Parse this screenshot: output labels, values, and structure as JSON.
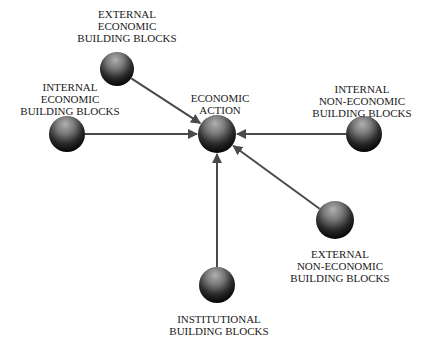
{
  "diagram": {
    "type": "hub-and-spoke",
    "background": "#ffffff",
    "colors": {
      "edge": "#4a4a4a",
      "text": "#1a1a1a",
      "sphere_light": "#9a9a9a",
      "sphere_dark": "#0a0a0a"
    },
    "center": {
      "id": "economic-action",
      "label_lines": [
        "ECONOMIC",
        "ACTION"
      ],
      "x": 217,
      "y": 134,
      "r": 19
    },
    "nodes": [
      {
        "id": "external-economic",
        "label_lines": [
          "EXTERNAL",
          "ECONOMIC",
          "BUILDING BLOCKS"
        ],
        "x": 117,
        "y": 69,
        "r": 17,
        "label_x": 127,
        "label_y": [
          18,
          30,
          42
        ]
      },
      {
        "id": "internal-economic",
        "label_lines": [
          "INTERNAL",
          "ECONOMIC",
          "BUILDING BLOCKS"
        ],
        "x": 67,
        "y": 134,
        "r": 18,
        "label_x": 70,
        "label_y": [
          91,
          103,
          115
        ]
      },
      {
        "id": "internal-non-economic",
        "label_lines": [
          "INTERNAL",
          "NON-ECONOMIC",
          "BUILDING BLOCKS"
        ],
        "x": 364,
        "y": 134,
        "r": 18,
        "label_x": 362,
        "label_y": [
          93,
          105,
          117
        ]
      },
      {
        "id": "external-non-economic",
        "label_lines": [
          "EXTERNAL",
          "NON-ECONOMIC",
          "BUILDING BLOCKS"
        ],
        "x": 335,
        "y": 220,
        "r": 19,
        "label_x": 340,
        "label_y": [
          258,
          270,
          282
        ]
      },
      {
        "id": "institutional",
        "label_lines": [
          "INSTITUTIONAL",
          "BUILDING BLOCKS"
        ],
        "x": 217,
        "y": 285,
        "r": 18,
        "label_x": 219,
        "label_y": [
          323,
          335
        ]
      }
    ],
    "edges": [
      {
        "from": "external-economic",
        "to": "economic-action"
      },
      {
        "from": "internal-economic",
        "to": "economic-action"
      },
      {
        "from": "internal-non-economic",
        "to": "economic-action"
      },
      {
        "from": "external-non-economic",
        "to": "economic-action"
      },
      {
        "from": "institutional",
        "to": "economic-action"
      }
    ]
  }
}
